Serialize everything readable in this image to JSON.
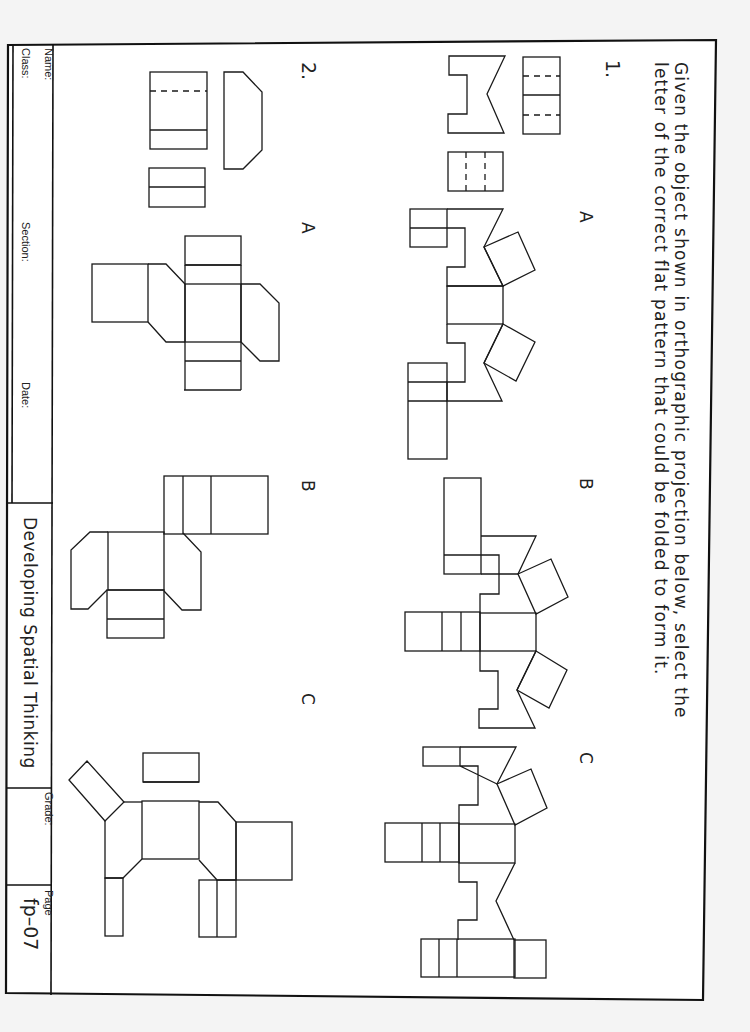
{
  "instructions": {
    "line1": "Given the object shown in orthographic projection below, select the",
    "line2": "letter of the correct flat pattern that could be folded to form it."
  },
  "problems": [
    {
      "number": "1.",
      "options": [
        {
          "letter": "A"
        },
        {
          "letter": "B"
        },
        {
          "letter": "C"
        }
      ]
    },
    {
      "number": "2.",
      "options": [
        {
          "letter": "A"
        },
        {
          "letter": "B"
        },
        {
          "letter": "C"
        }
      ]
    }
  ],
  "title_block": {
    "name_label": "Name:",
    "class_label": "Class:",
    "section_label": "Section:",
    "date_label": "Date:",
    "course_title": "Developing Spatial Thinking",
    "grade_label": "Grade:",
    "page_label": "Page",
    "page_id": "fp–07"
  },
  "colors": {
    "line": "#1a1a1a",
    "paper": "#ffffff",
    "background": "#f4f4f4"
  }
}
